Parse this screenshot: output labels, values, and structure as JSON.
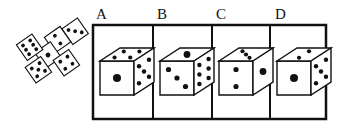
{
  "puzzle": {
    "type": "cube-net-folding",
    "net": {
      "faces": [
        {
          "id": "top-right",
          "pips": 3
        },
        {
          "id": "upper-middle",
          "pips": 2
        },
        {
          "id": "center",
          "pips": 1
        },
        {
          "id": "left",
          "pips": 6
        },
        {
          "id": "bottom-left",
          "pips": 5
        },
        {
          "id": "bottom-right",
          "pips": 4
        }
      ]
    },
    "options": [
      {
        "label": "A",
        "top": 4,
        "front": 1,
        "right": 5
      },
      {
        "label": "B",
        "top": 1,
        "front": 3,
        "right": 6
      },
      {
        "label": "C",
        "top": 3,
        "front": 2,
        "right": 1
      },
      {
        "label": "D",
        "top": 2,
        "front": 1,
        "right": 5
      }
    ]
  },
  "colors": {
    "ink": "#111111",
    "background": "#ffffff"
  }
}
